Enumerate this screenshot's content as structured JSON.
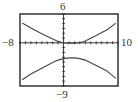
{
  "chart_data": {
    "type": "line",
    "title": "",
    "xlabel": "",
    "ylabel": "",
    "xlim": [
      -8,
      10
    ],
    "ylim": [
      -9,
      6
    ],
    "window_labels": {
      "xmin": "−8",
      "xmax": "10",
      "ymin": "−9",
      "ymax": "6"
    },
    "grid": false,
    "axis_ticks": {
      "x_step": 1,
      "y_step": 1
    },
    "series": [
      {
        "name": "upper branch",
        "x": [
          -7.6,
          -6,
          -4,
          -2,
          -1,
          0,
          1,
          1.5,
          2,
          3,
          4,
          6,
          8,
          9.6
        ],
        "y": [
          4.1,
          3.1,
          1.9,
          0.8,
          0.3,
          -0.05,
          -0.1,
          -0.1,
          -0.1,
          0.0,
          0.4,
          1.5,
          2.7,
          4.1
        ]
      },
      {
        "name": "lower branch",
        "x": [
          -7.6,
          -6,
          -4,
          -2,
          -1,
          0,
          1,
          1.5,
          2,
          3,
          4,
          6,
          8,
          9.6
        ],
        "y": [
          -7.7,
          -6.5,
          -5.3,
          -4.1,
          -3.6,
          -3.3,
          -3.15,
          -3.1,
          -3.15,
          -3.3,
          -3.6,
          -4.7,
          -5.9,
          -7.4
        ]
      }
    ]
  },
  "labels": {
    "ymax": "6",
    "ymin": "−9",
    "xmin": "−8",
    "xmax": "10"
  },
  "colors": {
    "frame": "#333333",
    "axis": "#222222",
    "curve": "#444444",
    "background": "#ffffff"
  }
}
